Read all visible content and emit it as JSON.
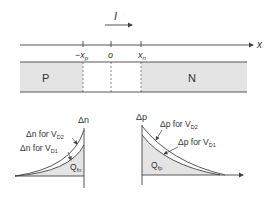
{
  "top": {
    "current_label": "I",
    "axis_label": "x",
    "ticks": [
      {
        "label": "−x",
        "sub": "p"
      },
      {
        "label": "o",
        "sub": ""
      },
      {
        "label": "x",
        "sub": "n"
      }
    ],
    "p_region_label": "P",
    "n_region_label": "N"
  },
  "left_plot": {
    "axis_label": "Δn",
    "curve_high_label": "Δn for V",
    "curve_high_sub": "D2",
    "curve_low_label": "Δn for V",
    "curve_low_sub": "D1",
    "area_label": "Q",
    "area_sub": "fn"
  },
  "right_plot": {
    "axis_label": "Δp",
    "curve_high_label": "Δp for V",
    "curve_high_sub": "D2",
    "curve_low_label": "Δp for V",
    "curve_low_sub": "D1",
    "area_label": "Q",
    "area_sub": "fp"
  },
  "colors": {
    "shade": "#e4e4e4",
    "line": "#444444"
  }
}
